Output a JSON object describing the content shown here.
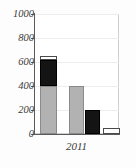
{
  "chart_data": {
    "type": "bar",
    "title": "",
    "xlabel": "",
    "ylabel": "",
    "categories": [
      "2011"
    ],
    "ylim": [
      0,
      1000
    ],
    "yticks": [
      0,
      200,
      400,
      600,
      800,
      1000
    ],
    "ytick_labels": [
      "0",
      "200",
      "400",
      "600",
      "800",
      "1000"
    ],
    "grid": true,
    "legend": "none",
    "bars": [
      {
        "name": "bar-1-stacked",
        "stacked": true,
        "total": 650,
        "segments": [
          {
            "name": "gray-segment",
            "value": 400,
            "from": 0,
            "to": 400,
            "color": "#b2b2b2"
          },
          {
            "name": "black-segment",
            "value": 220,
            "from": 400,
            "to": 620,
            "color": "#141414"
          },
          {
            "name": "white-segment",
            "value": 30,
            "from": 620,
            "to": 650,
            "color": "#ffffff"
          }
        ]
      },
      {
        "name": "bar-2-gray",
        "stacked": false,
        "total": 400,
        "segments": [
          {
            "name": "gray-segment",
            "value": 400,
            "from": 0,
            "to": 400,
            "color": "#b2b2b2"
          }
        ]
      },
      {
        "name": "bar-3-black",
        "stacked": false,
        "total": 200,
        "segments": [
          {
            "name": "black-segment",
            "value": 200,
            "from": 0,
            "to": 200,
            "color": "#141414"
          }
        ]
      },
      {
        "name": "bar-4-white",
        "stacked": false,
        "total": 50,
        "segments": [
          {
            "name": "white-segment",
            "value": 50,
            "from": 0,
            "to": 50,
            "color": "#ffffff"
          }
        ]
      }
    ],
    "geometry": {
      "plot_left_px": 34,
      "plot_top_px": 14,
      "plot_width_px": 85,
      "plot_height_px": 120,
      "bar_positions_px": [
        {
          "left": 6,
          "width": 17
        },
        {
          "left": 35,
          "width": 15
        },
        {
          "left": 51,
          "width": 15
        },
        {
          "left": 69,
          "width": 17
        }
      ]
    },
    "colors": {
      "gray": "#b2b2b2",
      "black": "#141414",
      "white": "#ffffff",
      "axis": "#5a5a5a",
      "grid": "#ededed",
      "text": "#3a3a3a"
    }
  }
}
